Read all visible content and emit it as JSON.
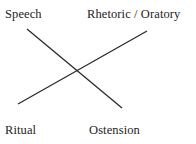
{
  "diagram": {
    "type": "chiasmus-cross",
    "width": 196,
    "height": 144,
    "background_color": "#ffffff",
    "line_color": "#2a2a2a",
    "text_color": "#232323",
    "labels": [
      {
        "id": "speech",
        "text": "Speech",
        "position": "top-left"
      },
      {
        "id": "rhetoric",
        "text": "Rhetoric / Oratory",
        "position": "top-right"
      },
      {
        "id": "ritual",
        "text": "Ritual",
        "position": "bottom-left"
      },
      {
        "id": "ostension",
        "text": "Ostension",
        "position": "bottom-right"
      }
    ],
    "connections": [
      {
        "id": "speech-to-ostension",
        "from": "speech",
        "to": "ostension",
        "x1": 27,
        "y1": 29,
        "x2": 122,
        "y2": 108
      },
      {
        "id": "ritual-to-rhetoric",
        "from": "ritual",
        "to": "rhetoric",
        "x1": 18,
        "y1": 104,
        "x2": 147,
        "y2": 31
      }
    ],
    "intersection": {
      "x": 77,
      "y": 71
    }
  }
}
